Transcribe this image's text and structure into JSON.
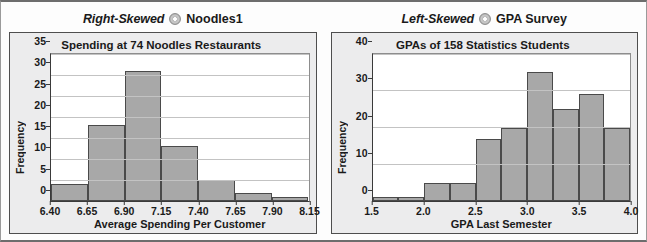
{
  "panels": [
    {
      "skew_label": "Right-Skewed",
      "icon": "disc-icon",
      "dataset_label": "Noodles1",
      "chart_data": {
        "type": "bar",
        "title": "Spending at 74 Noodles Restaurants",
        "xlabel": "Average Spending Per Customer",
        "ylabel": "Frequency",
        "grid": true,
        "legend": "none",
        "xlim": [
          6.4,
          8.15
        ],
        "ylim": [
          0,
          35
        ],
        "xticks": [
          6.4,
          6.65,
          6.9,
          7.15,
          7.4,
          7.65,
          7.9,
          8.15
        ],
        "xtick_labels": [
          "6.40",
          "6.65",
          "6.90",
          "7.15",
          "7.40",
          "7.65",
          "7.90",
          "8.15"
        ],
        "yticks": [
          0,
          5,
          10,
          15,
          20,
          25,
          30,
          35
        ],
        "ytick_labels": [
          "0",
          "5",
          "10",
          "15",
          "20",
          "25",
          "30",
          "35"
        ],
        "bin_width": 0.25,
        "bin_edges": [
          6.4,
          6.65,
          6.9,
          7.15,
          7.4,
          7.65,
          7.9,
          8.15
        ],
        "categories": [
          "6.40-6.65",
          "6.65-6.90",
          "6.90-7.15",
          "7.15-7.40",
          "7.40-7.65",
          "7.65-7.90",
          "7.90-8.15"
        ],
        "values": [
          4,
          18,
          31,
          13,
          5,
          2,
          1
        ]
      }
    },
    {
      "skew_label": "Left-Skewed",
      "icon": "disc-icon",
      "dataset_label": "GPA Survey",
      "chart_data": {
        "type": "bar",
        "title": "GPAs of 158 Statistics Students",
        "xlabel": "GPA Last Semester",
        "ylabel": "Frequency",
        "grid": true,
        "legend": "none",
        "xlim": [
          1.5,
          4.0
        ],
        "ylim": [
          0,
          40
        ],
        "xticks": [
          1.5,
          2.0,
          2.5,
          3.0,
          3.5,
          4.0
        ],
        "xtick_labels": [
          "1.5",
          "2.0",
          "2.5",
          "3.0",
          "3.5",
          "4.0"
        ],
        "yticks": [
          0,
          10,
          20,
          30,
          40
        ],
        "ytick_labels": [
          "0",
          "10",
          "20",
          "30",
          "40"
        ],
        "bin_width": 0.25,
        "bin_edges": [
          1.5,
          1.75,
          2.0,
          2.25,
          2.5,
          2.75,
          3.0,
          3.25,
          3.5,
          3.75,
          4.0
        ],
        "categories": [
          "1.50-1.75",
          "1.75-2.00",
          "2.00-2.25",
          "2.25-2.50",
          "2.50-2.75",
          "2.75-3.00",
          "3.00-3.25",
          "3.25-3.50",
          "3.50-3.75",
          "3.75-4.00"
        ],
        "values": [
          1,
          1,
          5,
          5,
          17,
          20,
          35,
          25,
          29,
          20
        ]
      }
    }
  ],
  "colors": {
    "bar_fill": "#a8a8a8",
    "bar_stroke": "#4a4a4a",
    "panel_bg": "#ececed",
    "plot_bg": "#ffffff",
    "grid": "#c3c3c3",
    "axis": "#3a3a3a",
    "text": "#1a1a1a"
  }
}
